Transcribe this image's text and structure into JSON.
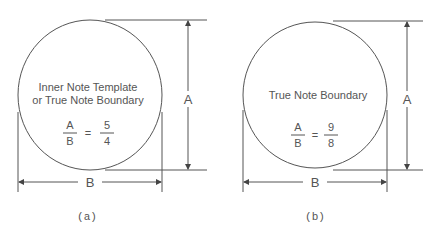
{
  "figure_a": {
    "label_lines": [
      "Inner Note Template",
      "or True Note Boundary"
    ],
    "ratio": {
      "num_left": "A",
      "den_left": "B",
      "eq": "=",
      "num_right": "5",
      "den_right": "4"
    },
    "dim_height": "A",
    "dim_width": "B",
    "caption": "(a)"
  },
  "figure_b": {
    "label_lines": [
      "True Note Boundary"
    ],
    "ratio": {
      "num_left": "A",
      "den_left": "B",
      "eq": "=",
      "num_right": "9",
      "den_right": "8"
    },
    "dim_height": "A",
    "dim_width": "B",
    "caption": "(b)"
  }
}
